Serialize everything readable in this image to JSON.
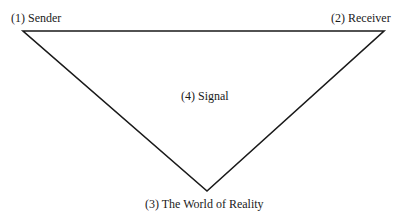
{
  "diagram": {
    "type": "triangle",
    "vertices": {
      "sender": [
        23,
        31
      ],
      "receiver": [
        384,
        31
      ],
      "reality": [
        207,
        191
      ]
    },
    "labels": {
      "sender": "(1) Sender",
      "receiver": "(2) Receiver",
      "reality": "(3) The World of Reality",
      "signal": "(4) Signal"
    },
    "line_color": "#1a1a1a"
  }
}
